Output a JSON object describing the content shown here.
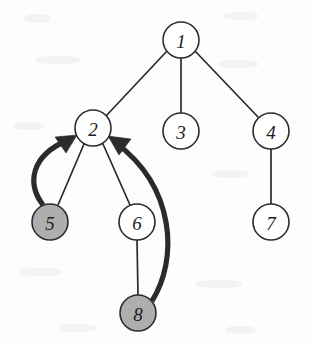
{
  "figure": {
    "kind": "directed-graph-diagram",
    "width": 311,
    "height": 347,
    "background_color": "#fdfdfd"
  },
  "style": {
    "node_radius": 18,
    "node_stroke_color": "#2b2b2b",
    "node_fill_default": "#ffffff",
    "node_fill_highlight": "#aeaeae",
    "tree_edge_color": "#2b2b2b",
    "back_edge_color": "#2b2b2b",
    "label_color": "#1c1c1c"
  },
  "nodes": [
    {
      "id": "node-1",
      "label": "1",
      "cx": 181,
      "cy": 40,
      "r": 18,
      "fill": "#ffffff",
      "shaded": false
    },
    {
      "id": "node-2",
      "label": "2",
      "cx": 93,
      "cy": 128,
      "r": 18,
      "fill": "#ffffff",
      "shaded": false
    },
    {
      "id": "node-3",
      "label": "3",
      "cx": 181,
      "cy": 131,
      "r": 18,
      "fill": "#ffffff",
      "shaded": false
    },
    {
      "id": "node-4",
      "label": "4",
      "cx": 271,
      "cy": 131,
      "r": 18,
      "fill": "#ffffff",
      "shaded": false
    },
    {
      "id": "node-5",
      "label": "5",
      "cx": 50,
      "cy": 222,
      "r": 18,
      "fill": "#aeaeae",
      "shaded": true
    },
    {
      "id": "node-6",
      "label": "6",
      "cx": 137,
      "cy": 222,
      "r": 18,
      "fill": "#ffffff",
      "shaded": false
    },
    {
      "id": "node-7",
      "label": "7",
      "cx": 271,
      "cy": 222,
      "r": 18,
      "fill": "#ffffff",
      "shaded": false
    },
    {
      "id": "node-8",
      "label": "8",
      "cx": 138,
      "cy": 313,
      "r": 18,
      "fill": "#aeaeae",
      "shaded": true
    }
  ],
  "tree_edges": [
    {
      "id": "edge-1-2",
      "from": "1",
      "to": "2",
      "x1": 167,
      "y1": 51,
      "x2": 106,
      "y2": 116
    },
    {
      "id": "edge-1-3",
      "from": "1",
      "to": "3",
      "x1": 181,
      "y1": 58,
      "x2": 181,
      "y2": 113
    },
    {
      "id": "edge-1-4",
      "from": "1",
      "to": "4",
      "x1": 195,
      "y1": 51,
      "x2": 258,
      "y2": 117
    },
    {
      "id": "edge-2-5",
      "from": "2",
      "to": "5",
      "x1": 84,
      "y1": 144,
      "x2": 58,
      "y2": 205
    },
    {
      "id": "edge-2-6",
      "from": "2",
      "to": "6",
      "x1": 103,
      "y1": 144,
      "x2": 130,
      "y2": 205
    },
    {
      "id": "edge-4-7",
      "from": "4",
      "to": "7",
      "x1": 271,
      "y1": 149,
      "x2": 271,
      "y2": 204
    },
    {
      "id": "edge-6-8",
      "from": "6",
      "to": "8",
      "x1": 137,
      "y1": 240,
      "x2": 138,
      "y2": 295
    }
  ],
  "back_edges": [
    {
      "id": "back-edge-5-2",
      "from": "5",
      "to": "2",
      "path": "M 43 205 C 27 184 30 156 68 140",
      "arrow_points": "68,140 53,140 62,152",
      "arrow_tip_x": 74,
      "arrow_tip_y": 137
    },
    {
      "id": "back-edge-8-2",
      "from": "8",
      "to": "2",
      "path": "M 152 301 C 176 262 176 190 115 142",
      "arrow_points": "115,142 130,141 122,154",
      "arrow_tip_x": 110,
      "arrow_tip_y": 138
    }
  ],
  "legend": {
    "shaded_meaning": "",
    "caption": ""
  }
}
